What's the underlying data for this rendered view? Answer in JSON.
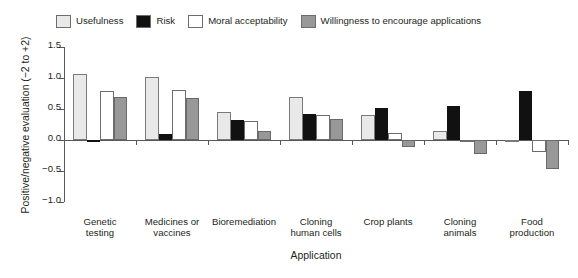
{
  "chart_data": {
    "type": "bar",
    "title": "",
    "subtitle": "",
    "xlabel": "Application",
    "ylabel": "Positive/negative evaluation (−2 to +2)",
    "ylim": [
      -1.0,
      1.5
    ],
    "yticks": [
      -1.0,
      -0.5,
      0.0,
      0.5,
      1.0,
      1.5
    ],
    "ytick_labels": [
      "−1.0",
      "−0.5",
      "0.0",
      "0.5",
      "1.0",
      "1.5"
    ],
    "grid": false,
    "legend_position": "top",
    "categories": [
      "Genetic testing",
      "Medicines or vaccines",
      "Bioremediation",
      "Cloning human cells",
      "Crop plants",
      "Cloning animals",
      "Food production"
    ],
    "category_label_lines": [
      [
        "Genetic",
        "testing"
      ],
      [
        "Medicines or",
        "vaccines"
      ],
      [
        "Bioremediation"
      ],
      [
        "Cloning",
        "human cells"
      ],
      [
        "Crop plants"
      ],
      [
        "Cloning",
        "animals"
      ],
      [
        "Food",
        "production"
      ]
    ],
    "series": [
      {
        "name": "Usefulness",
        "color": "#e9e9e9",
        "values": [
          1.07,
          1.02,
          0.45,
          0.69,
          0.41,
          0.15,
          -0.03
        ]
      },
      {
        "name": "Risk",
        "color": "#111111",
        "values": [
          -0.03,
          0.1,
          0.33,
          0.42,
          0.52,
          0.55,
          0.79
        ]
      },
      {
        "name": "Moral acceptability",
        "color": "#ffffff",
        "values": [
          0.79,
          0.8,
          0.3,
          0.4,
          0.12,
          -0.02,
          -0.2
        ]
      },
      {
        "name": "Willingness to encourage applications",
        "color": "#989898",
        "values": [
          0.69,
          0.68,
          0.15,
          0.34,
          -0.12,
          -0.22,
          -0.46
        ]
      }
    ]
  },
  "legend": {
    "entries": [
      {
        "label": "Usefulness",
        "color": "#e9e9e9"
      },
      {
        "label": "Risk",
        "color": "#111111"
      },
      {
        "label": "Moral acceptability",
        "color": "#ffffff"
      },
      {
        "label": "Willingness to encourage applications",
        "color": "#989898"
      }
    ]
  }
}
